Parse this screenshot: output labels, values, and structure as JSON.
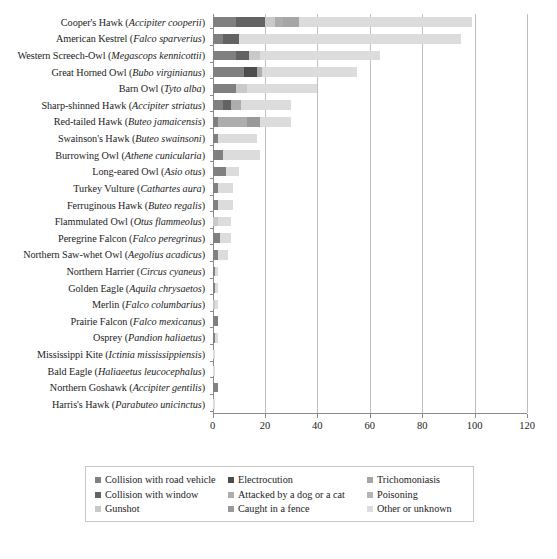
{
  "chart_data": {
    "type": "bar",
    "orientation": "horizontal",
    "stacked": true,
    "title": "",
    "subtitle": "",
    "xlabel": "",
    "ylabel": "",
    "xlim": [
      0,
      120
    ],
    "xticks": [
      0,
      20,
      40,
      60,
      80,
      100,
      120
    ],
    "grid": "vertical",
    "legend_position": "bottom",
    "series": [
      {
        "name": "Collision with road vehicle",
        "color": "#808080"
      },
      {
        "name": "Collision with window",
        "color": "#636363"
      },
      {
        "name": "Gunshot",
        "color": "#c9c9c9"
      },
      {
        "name": "Electrocution",
        "color": "#4d4d4d"
      },
      {
        "name": "Attacked by a dog or a cat",
        "color": "#adadad"
      },
      {
        "name": "Caught in a fence",
        "color": "#999999"
      },
      {
        "name": "Trichomoniasis",
        "color": "#a6a6a6"
      },
      {
        "name": "Poisoning",
        "color": "#b5b5b5"
      },
      {
        "name": "Other or unknown",
        "color": "#dcdcdc"
      }
    ],
    "categories": [
      "Cooper's Hawk (Accipiter cooperii)",
      "American Kestrel (Falco sparverius)",
      "Western Screech-Owl (Megascops kennicottii)",
      "Great Horned Owl (Bubo virginianus)",
      "Barn Owl (Tyto alba)",
      "Sharp-shinned Hawk (Accipiter striatus)",
      "Red-tailed Hawk (Buteo jamaicensis)",
      "Swainson's Hawk (Buteo swainsoni)",
      "Burrowing Owl (Athene cunicularia)",
      "Long-eared Owl (Asio otus)",
      "Turkey Vulture (Cathartes aura)",
      "Ferruginous Hawk (Buteo regalis)",
      "Flammulated Owl (Otus flammeolus)",
      "Peregrine Falcon (Falco peregrinus)",
      "Northern Saw-whet Owl (Aegolius acadicus)",
      "Northern Harrier (Circus cyaneus)",
      "Golden Eagle (Aquila chrysaetos)",
      "Merlin (Falco columbarius)",
      "Prairie Falcon (Falco mexicanus)",
      "Osprey (Pandion haliaetus)",
      "Mississippi Kite (Ictinia mississippiensis)",
      "Bald Eagle (Haliaeetus leucocephalus)",
      "Northern Goshawk (Accipiter gentilis)",
      "Harris's Hawk (Parabuteo unicinctus)"
    ],
    "totals": [
      99,
      95,
      64,
      55,
      40,
      30,
      30,
      17,
      18,
      10,
      8,
      8,
      7,
      7,
      6,
      2,
      2,
      2,
      2,
      2,
      1,
      1,
      2,
      1
    ],
    "rows": [
      {
        "category": "Cooper's Hawk (Accipiter cooperii)",
        "values": [
          9,
          11,
          4,
          0,
          3,
          0,
          6,
          0,
          66
        ]
      },
      {
        "category": "American Kestrel (Falco sparverius)",
        "values": [
          4,
          6,
          0,
          0,
          0,
          0,
          0,
          0,
          85
        ]
      },
      {
        "category": "Western Screech-Owl (Megascops kennicottii)",
        "values": [
          9,
          5,
          4,
          0,
          0,
          0,
          0,
          0,
          46
        ]
      },
      {
        "category": "Great Horned Owl (Bubo virginianus)",
        "values": [
          12,
          0,
          0,
          5,
          2,
          0,
          0,
          0,
          36
        ]
      },
      {
        "category": "Barn Owl (Tyto alba)",
        "values": [
          9,
          0,
          4,
          0,
          0,
          0,
          0,
          0,
          27
        ]
      },
      {
        "category": "Sharp-shinned Hawk (Accipiter striatus)",
        "values": [
          4,
          3,
          0,
          0,
          4,
          0,
          0,
          0,
          19
        ]
      },
      {
        "category": "Red-tailed Hawk (Buteo jamaicensis)",
        "values": [
          2,
          0,
          0,
          0,
          11,
          5,
          0,
          0,
          12
        ]
      },
      {
        "category": "Swainson's Hawk (Buteo swainsoni)",
        "values": [
          2,
          0,
          0,
          0,
          0,
          0,
          0,
          0,
          15
        ]
      },
      {
        "category": "Burrowing Owl (Athene cunicularia)",
        "values": [
          4,
          0,
          0,
          0,
          0,
          0,
          0,
          0,
          14
        ]
      },
      {
        "category": "Long-eared Owl (Asio otus)",
        "values": [
          5,
          0,
          0,
          0,
          0,
          0,
          0,
          0,
          5
        ]
      },
      {
        "category": "Turkey Vulture (Cathartes aura)",
        "values": [
          2,
          0,
          0,
          0,
          0,
          0,
          0,
          0,
          6
        ]
      },
      {
        "category": "Ferruginous Hawk (Buteo regalis)",
        "values": [
          2,
          0,
          0,
          0,
          0,
          0,
          0,
          0,
          6
        ]
      },
      {
        "category": "Flammulated Owl (Otus flammeolus)",
        "values": [
          0,
          0,
          2,
          0,
          0,
          0,
          0,
          0,
          5
        ]
      },
      {
        "category": "Peregrine Falcon (Falco peregrinus)",
        "values": [
          3,
          0,
          0,
          0,
          0,
          0,
          0,
          0,
          4
        ]
      },
      {
        "category": "Northern Saw-whet Owl (Aegolius acadicus)",
        "values": [
          2,
          0,
          0,
          0,
          0,
          0,
          0,
          0,
          4
        ]
      },
      {
        "category": "Northern Harrier (Circus cyaneus)",
        "values": [
          1,
          0,
          0,
          0,
          0,
          0,
          0,
          0,
          1
        ]
      },
      {
        "category": "Golden Eagle (Aquila chrysaetos)",
        "values": [
          1,
          0,
          0,
          0,
          0,
          0,
          0,
          0,
          1
        ]
      },
      {
        "category": "Merlin (Falco columbarius)",
        "values": [
          0,
          0,
          1,
          0,
          0,
          0,
          0,
          0,
          1
        ]
      },
      {
        "category": "Prairie Falcon (Falco mexicanus)",
        "values": [
          2,
          0,
          0,
          0,
          0,
          0,
          0,
          0,
          0
        ]
      },
      {
        "category": "Osprey (Pandion haliaetus)",
        "values": [
          1,
          0,
          0,
          0,
          0,
          0,
          0,
          0,
          1
        ]
      },
      {
        "category": "Mississippi Kite (Ictinia mississippiensis)",
        "values": [
          0,
          0,
          0,
          0,
          0,
          0,
          0,
          0,
          1
        ]
      },
      {
        "category": "Bald Eagle (Haliaeetus leucocephalus)",
        "values": [
          0,
          0,
          0,
          0,
          0,
          0,
          0,
          0,
          1
        ]
      },
      {
        "category": "Northern Goshawk (Accipiter gentilis)",
        "values": [
          2,
          0,
          0,
          0,
          0,
          0,
          0,
          0,
          0
        ]
      },
      {
        "category": "Harris's Hawk (Parabuteo unicinctus)",
        "values": [
          0,
          0,
          0,
          0,
          0,
          0,
          0,
          0,
          1
        ]
      }
    ]
  },
  "axis": {
    "x_tick_labels": [
      "0",
      "20",
      "40",
      "60",
      "80",
      "100",
      "120"
    ]
  },
  "legend": {
    "items": [
      {
        "label": "Collision with road vehicle",
        "color": "#808080"
      },
      {
        "label": "Electrocution",
        "color": "#4d4d4d"
      },
      {
        "label": "Trichomoniasis",
        "color": "#a6a6a6"
      },
      {
        "label": "Collision with window",
        "color": "#636363"
      },
      {
        "label": "Attacked by a dog or a cat",
        "color": "#adadad"
      },
      {
        "label": "Poisoning",
        "color": "#b5b5b5"
      },
      {
        "label": "Gunshot",
        "color": "#c9c9c9"
      },
      {
        "label": "Caught in a fence",
        "color": "#999999"
      },
      {
        "label": "Other or unknown",
        "color": "#dcdcdc"
      }
    ]
  }
}
